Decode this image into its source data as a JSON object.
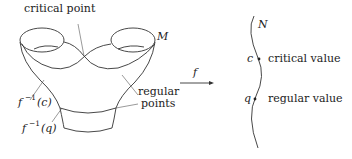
{
  "diagram": {
    "labels": {
      "critical_point": "critical point",
      "manifold_M": "M",
      "preimage_c_base": "f",
      "preimage_c_exp": "−1",
      "preimage_c_arg": "(c)",
      "preimage_q_base": "f",
      "preimage_q_exp": "−1",
      "preimage_q_arg": "(q)",
      "regular_points_line1": "regular",
      "regular_points_line2": "points",
      "map_f": "f",
      "manifold_N": "N",
      "value_c": "c",
      "critical_value": "critical value",
      "value_q": "q",
      "regular_value": "regular value"
    }
  }
}
